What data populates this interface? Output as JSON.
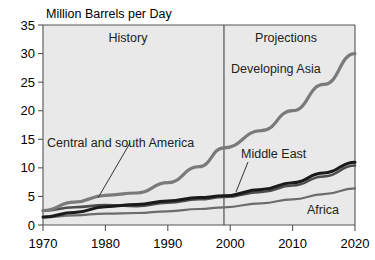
{
  "chart_data": {
    "type": "line",
    "title": "Million Barrels per Day",
    "xlabel": "",
    "ylabel": "Million Barrels per Day",
    "xlim": [
      1970,
      2020
    ],
    "ylim": [
      0,
      35
    ],
    "xticks": [
      1970,
      1980,
      1990,
      2000,
      2010,
      2020
    ],
    "yticks": [
      0,
      5,
      10,
      15,
      20,
      25,
      30,
      35
    ],
    "grid": false,
    "legend_position": "inline-annotations",
    "annotations": [
      {
        "text": "History",
        "x": 1983,
        "y": 33.5
      },
      {
        "text": "Projections",
        "x": 2010,
        "y": 33.5
      },
      {
        "text": "Central and south America",
        "x": 1974,
        "y": 15.2
      },
      {
        "text": "Developing Asia",
        "x": 2002,
        "y": 26.6
      },
      {
        "text": "Middle East",
        "x": 2004,
        "y": 12.3
      },
      {
        "text": "Africa",
        "x": 2013,
        "y": 4.0
      }
    ],
    "divider": {
      "x": 1999,
      "label_left": "History",
      "label_right": "Projections"
    },
    "x": [
      1970,
      1975,
      1980,
      1985,
      1990,
      1995,
      1999,
      2005,
      2010,
      2015,
      2020
    ],
    "series": [
      {
        "name": "Developing Asia",
        "color": "#7a7a7a",
        "width": 3.2,
        "values": [
          2.5,
          4.0,
          5.2,
          5.6,
          7.4,
          10.2,
          13.5,
          16.5,
          20.0,
          24.6,
          30.0
        ]
      },
      {
        "name": "Middle East",
        "color": "#1a1a1a",
        "width": 3.0,
        "values": [
          1.4,
          2.2,
          3.2,
          3.6,
          4.2,
          4.8,
          5.1,
          6.2,
          7.4,
          9.1,
          11.0
        ]
      },
      {
        "name": "Central and south America",
        "color": "#4d4d4d",
        "width": 2.6,
        "values": [
          2.5,
          3.1,
          3.5,
          3.3,
          3.9,
          4.5,
          4.9,
          5.8,
          6.9,
          8.5,
          10.4
        ]
      },
      {
        "name": "Africa",
        "color": "#6b6b6b",
        "width": 2.2,
        "values": [
          1.3,
          1.7,
          2.0,
          2.1,
          2.4,
          2.8,
          3.1,
          3.8,
          4.5,
          5.4,
          6.4
        ]
      }
    ]
  },
  "labels": {
    "chart_title": "Million Barrels per Day",
    "history": "History",
    "projections": "Projections",
    "central_south_america": "Central and south America",
    "developing_asia": "Developing Asia",
    "middle_east": "Middle East",
    "africa": "Africa",
    "y0": "0",
    "y5": "5",
    "y10": "10",
    "y15": "15",
    "y20": "20",
    "y25": "25",
    "y30": "30",
    "y35": "35",
    "x1970": "1970",
    "x1980": "1980",
    "x1990": "1990",
    "x2000": "2000",
    "x2010": "2010",
    "x2020": "2020"
  }
}
